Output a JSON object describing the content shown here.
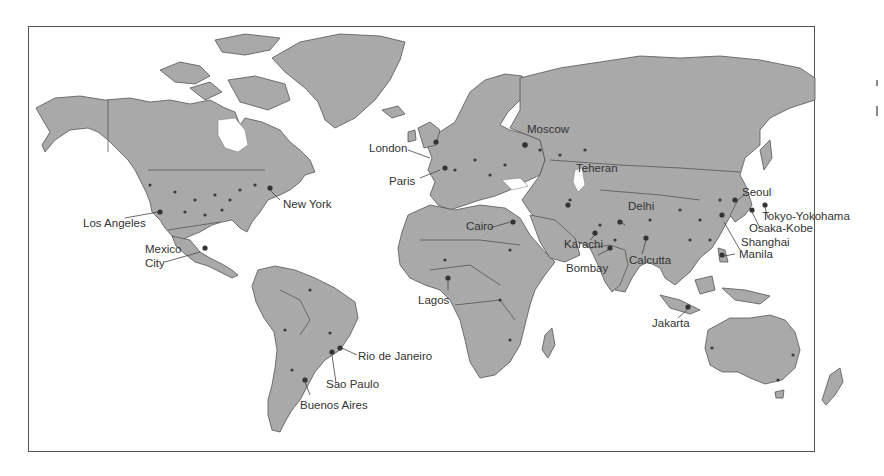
{
  "map": {
    "projection": "world",
    "land_color": "#a9a9a9",
    "water_color": "#ffffff",
    "border_color": "#555555",
    "cities": [
      {
        "name": "London",
        "label": "London"
      },
      {
        "name": "Paris",
        "label": "Paris"
      },
      {
        "name": "Moscow",
        "label": "Moscow"
      },
      {
        "name": "Teheran",
        "label": "Teheran"
      },
      {
        "name": "New York",
        "label": "New York"
      },
      {
        "name": "Los Angeles",
        "label": "Los Angeles"
      },
      {
        "name": "Mexico City",
        "label_line1": "Mexico",
        "label_line2": "City"
      },
      {
        "name": "Cairo",
        "label": "Cairo"
      },
      {
        "name": "Delhi",
        "label": "Delhi"
      },
      {
        "name": "Karachi",
        "label": "Karachi"
      },
      {
        "name": "Bombay",
        "label": "Bombay"
      },
      {
        "name": "Calcutta",
        "label": "Calcutta"
      },
      {
        "name": "Seoul",
        "label": "Seoul"
      },
      {
        "name": "Tokyo-Yokohama",
        "label": "Tokyo-Yokohama"
      },
      {
        "name": "Osaka-Kobe",
        "label": "Osaka-Kobe"
      },
      {
        "name": "Shanghai",
        "label": "Shanghai"
      },
      {
        "name": "Manila",
        "label": "Manila"
      },
      {
        "name": "Lagos",
        "label": "Lagos"
      },
      {
        "name": "Jakarta",
        "label": "Jakarta"
      },
      {
        "name": "Rio de Janeiro",
        "label": "Rio de Janeiro"
      },
      {
        "name": "Sao Paulo",
        "label": "Sao Paulo"
      },
      {
        "name": "Buenos Aires",
        "label": "Buenos Aires"
      }
    ]
  }
}
